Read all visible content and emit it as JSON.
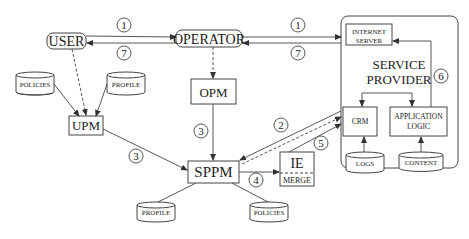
{
  "nodes": {
    "user": "USER",
    "operator": "OPERATOR",
    "opm": "OPM",
    "upm": "UPM",
    "sppm": "SPPM",
    "ie": "IE",
    "merge": "MERGE",
    "service_provider_line1": "SERVICE",
    "service_provider_line2": "PROVIDER",
    "internet_server_line1": "INTERNET",
    "internet_server_line2": "SERVER",
    "crm": "CRM",
    "app_logic_line1": "APPLICATION",
    "app_logic_line2": "LOGIC"
  },
  "databases": {
    "upm_policies": "POLICIES",
    "upm_profile": "PROFILE",
    "sppm_profile": "PROFILE",
    "sppm_policies": "POLICIES",
    "logs": "LOGS",
    "content": "CONTENT"
  },
  "steps": {
    "s1a": "1",
    "s7a": "7",
    "s1b": "1",
    "s7b": "7",
    "s3a": "3",
    "s3b": "3",
    "s2": "2",
    "s5": "5",
    "s4": "4",
    "s6": "6"
  }
}
